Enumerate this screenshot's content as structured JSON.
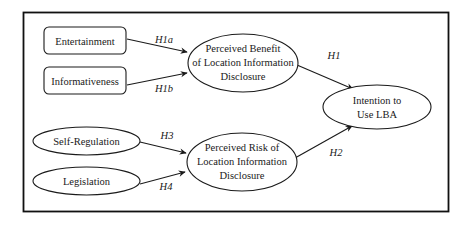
{
  "diagram": {
    "type": "research-model",
    "nodes": [
      {
        "id": "entertainment",
        "shape": "rounded-rect",
        "lines": [
          "Entertainment"
        ]
      },
      {
        "id": "informativeness",
        "shape": "rounded-rect",
        "lines": [
          "Informativeness"
        ]
      },
      {
        "id": "self_regulation",
        "shape": "ellipse",
        "lines": [
          "Self-Regulation"
        ]
      },
      {
        "id": "legislation",
        "shape": "ellipse",
        "lines": [
          "Legislation"
        ]
      },
      {
        "id": "benefit",
        "shape": "ellipse",
        "lines": [
          "Perceived Benefit",
          "of Location Information",
          "Disclosure"
        ]
      },
      {
        "id": "risk",
        "shape": "ellipse",
        "lines": [
          "Perceived Risk of",
          "Location Information",
          "Disclosure"
        ]
      },
      {
        "id": "intention",
        "shape": "ellipse",
        "lines": [
          "Intention to",
          "Use LBA"
        ]
      }
    ],
    "edges": [
      {
        "from": "entertainment",
        "to": "benefit",
        "label": "H1a"
      },
      {
        "from": "informativeness",
        "to": "benefit",
        "label": "H1b"
      },
      {
        "from": "benefit",
        "to": "intention",
        "label": "H1"
      },
      {
        "from": "self_regulation",
        "to": "risk",
        "label": "H3"
      },
      {
        "from": "legislation",
        "to": "risk",
        "label": "H4"
      },
      {
        "from": "risk",
        "to": "intention",
        "label": "H2"
      }
    ]
  },
  "colors": {
    "stroke": "#1a1a1a",
    "background": "#ffffff"
  }
}
